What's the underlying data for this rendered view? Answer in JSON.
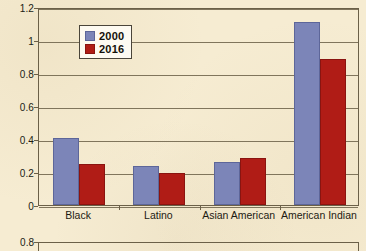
{
  "chart_data": {
    "type": "bar",
    "title": "",
    "xlabel": "",
    "ylabel": "",
    "categories": [
      "Black",
      "Latino",
      "Asian American",
      "American Indian"
    ],
    "series": [
      {
        "name": "2000",
        "color": "#7c85b8",
        "values": [
          0.405,
          0.235,
          0.26,
          1.11
        ]
      },
      {
        "name": "2016",
        "color": "#b01c16",
        "values": [
          0.25,
          0.195,
          0.285,
          0.885
        ]
      }
    ],
    "ylim": [
      0,
      1.2
    ],
    "ytick_labels": [
      "0",
      "0.2",
      "0.4",
      "0.6",
      "0.8",
      "1",
      "1.2"
    ],
    "ytick_values": [
      0,
      0.2,
      0.4,
      0.6,
      0.8,
      1.0,
      1.2
    ],
    "grid": true,
    "legend_position": "top-left-inside",
    "background_color": "#f6ecd2",
    "axis_color": "#6b6048"
  },
  "legend": {
    "entries": [
      {
        "label": "2000"
      },
      {
        "label": "2016"
      }
    ]
  },
  "partial_chart_below": {
    "ytick_label": "0.8"
  }
}
